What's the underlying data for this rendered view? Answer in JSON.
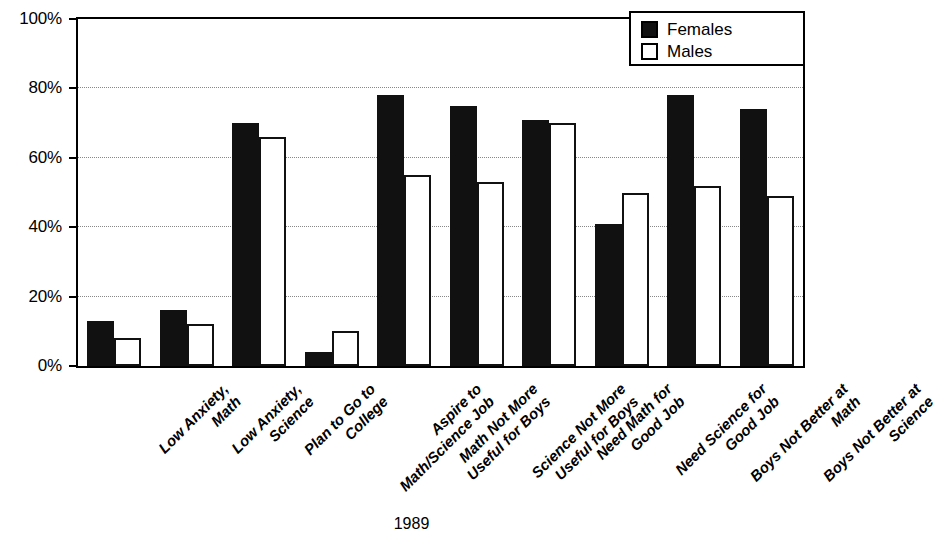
{
  "chart_data": {
    "type": "bar",
    "title": "",
    "xlabel": "1989",
    "ylabel": "",
    "ylim": [
      0,
      100
    ],
    "yticks": [
      "0%",
      "20%",
      "40%",
      "60%",
      "80%",
      "100%"
    ],
    "ytick_values": [
      0,
      20,
      40,
      60,
      80,
      100
    ],
    "grid": "horizontal-dotted-at-20-40-60-80",
    "legend_position": "top-right",
    "categories": [
      "Low Anxiety, Math",
      "Low Anxiety, Science",
      "Plan to Go to College",
      "Aspire to Math/Science Job",
      "Math Not More Useful for Boys",
      "Science Not More Useful for Boys",
      "Need Math for Good Job",
      "Need Science for Good Job",
      "Boys Not Better at Math",
      "Boys Not Better at Science"
    ],
    "category_lines": [
      [
        "Low Anxiety,",
        "Math"
      ],
      [
        "Low Anxiety,",
        "Science"
      ],
      [
        "Plan to Go to",
        "College"
      ],
      [
        "Aspire to",
        "Math/Science Job"
      ],
      [
        "Math Not More",
        "Useful for Boys"
      ],
      [
        "Science Not More",
        "Useful for Boys"
      ],
      [
        "Need Math for",
        "Good Job"
      ],
      [
        "Need Science for",
        "Good Job"
      ],
      [
        "Boys Not Better at",
        "Math"
      ],
      [
        "Boys Not Better at",
        "Science"
      ]
    ],
    "series": [
      {
        "name": "Females",
        "color": "#111111",
        "values": [
          13,
          16,
          70,
          4,
          78,
          75,
          71,
          41,
          78,
          74
        ]
      },
      {
        "name": "Males",
        "color": "#ffffff",
        "values": [
          8,
          12,
          66,
          10,
          55,
          53,
          70,
          50,
          52,
          49
        ]
      }
    ]
  },
  "legend": {
    "items": [
      {
        "label": "Females",
        "swatch": "filled-black-square"
      },
      {
        "label": "Males",
        "swatch": "empty-white-square"
      }
    ]
  },
  "axis": {
    "x_title": "1989"
  }
}
